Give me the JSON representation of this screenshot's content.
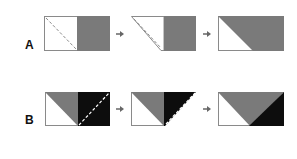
{
  "rows": [
    {
      "label": "A",
      "steps": [
        {
          "name": "square-with-rectangle",
          "description": "white square with dashed diagonal, gray square to the right"
        },
        {
          "name": "folded-corner",
          "description": "white square corner folded along diagonal"
        },
        {
          "name": "result",
          "description": "rectangle with white lower-left triangle and gray upper-right region"
        }
      ]
    },
    {
      "label": "B",
      "steps": [
        {
          "name": "two-squares",
          "description": "left square half gray/white, right square black with dashed white diagonal"
        },
        {
          "name": "folded",
          "description": "black square folded along diagonal"
        },
        {
          "name": "result",
          "description": "flying geese style: white left triangle, gray top, black bottom-right triangle"
        }
      ]
    }
  ],
  "arrow": "→",
  "colors": {
    "gray": "#7a7a7a",
    "black": "#0d0d0d",
    "white": "#ffffff",
    "outline": "#8a8a8a",
    "dash_dark": "#8a8a8a",
    "dash_light": "#ffffff"
  }
}
